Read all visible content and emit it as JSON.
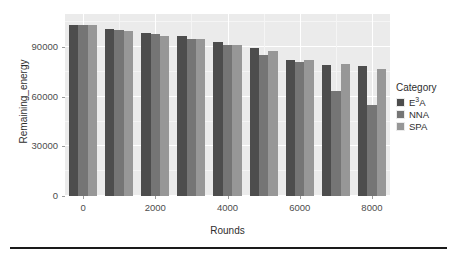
{
  "chart_data": {
    "type": "bar",
    "title": "",
    "xlabel": "Rounds",
    "ylabel": "Remaining_energy",
    "categories": [
      "0",
      "1000",
      "2000",
      "3000",
      "4000",
      "5000",
      "6000",
      "7000",
      "8000"
    ],
    "x": [
      0,
      1000,
      2000,
      3000,
      4000,
      5000,
      6000,
      7000,
      8000
    ],
    "series": [
      {
        "name": "E3A",
        "label": "E³A",
        "color": "#4d4d4d",
        "values": [
          103500,
          101000,
          98500,
          96500,
          92800,
          89700,
          82500,
          79000,
          78300
        ]
      },
      {
        "name": "NNA",
        "label": "NNA",
        "color": "#757575",
        "values": [
          103500,
          100500,
          97800,
          94700,
          91500,
          85200,
          80700,
          63500,
          55000
        ]
      },
      {
        "name": "SPA",
        "label": "SPA",
        "color": "#979797",
        "values": [
          103500,
          100000,
          96700,
          94700,
          91200,
          87800,
          82300,
          80000,
          76500
        ]
      }
    ],
    "ylim": [
      0,
      110000
    ],
    "yticks": [
      0,
      30000,
      60000,
      90000
    ],
    "ytick_labels": [
      "0",
      "30000",
      "60000",
      "90000"
    ],
    "xticks": [
      0,
      2000,
      4000,
      6000,
      8000
    ],
    "xtick_labels": [
      "0",
      "2000",
      "4000",
      "6000",
      "8000"
    ],
    "grid": true,
    "legend_position": "right",
    "legend_title": "Category",
    "panel_background": "#ebebeb",
    "grid_color": "#ffffff"
  },
  "legend": {
    "title": "Category",
    "entries": [
      {
        "label_html": "E³A",
        "label_main": "E",
        "label_sup": "3",
        "label_tail": "A",
        "color": "#4d4d4d"
      },
      {
        "label_html": "NNA",
        "label_main": "NNA",
        "label_sup": "",
        "label_tail": "",
        "color": "#757575"
      },
      {
        "label_html": "SPA",
        "label_main": "SPA",
        "label_sup": "",
        "label_tail": "",
        "color": "#979797"
      }
    ]
  },
  "axes": {
    "x_title": "Rounds",
    "y_title": "Remaining_energy"
  }
}
